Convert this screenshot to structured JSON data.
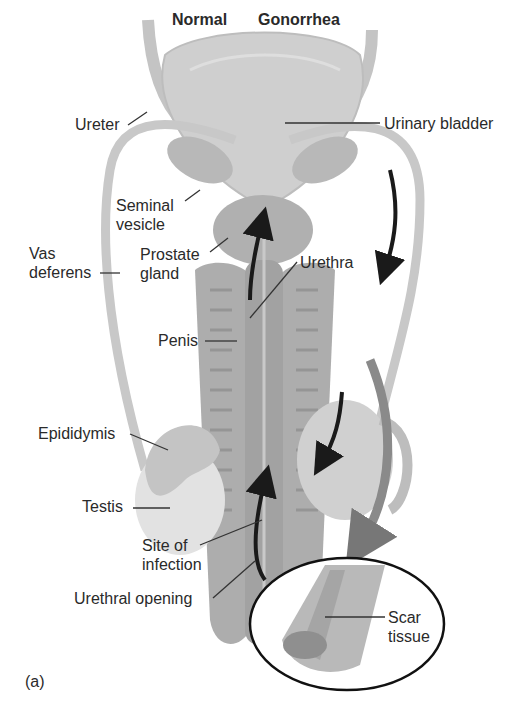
{
  "figure": {
    "panel_label": "(a)",
    "column_headers": {
      "left": "Normal",
      "right": "Gonorrhea"
    },
    "labels": {
      "ureter": "Ureter",
      "urinary_bladder": "Urinary bladder",
      "seminal_vesicle_1": "Seminal",
      "seminal_vesicle_2": "vesicle",
      "vas_deferens_1": "Vas",
      "vas_deferens_2": "deferens",
      "prostate_1": "Prostate",
      "prostate_2": "gland",
      "urethra": "Urethra",
      "penis": "Penis",
      "epididymis": "Epididymis",
      "testis": "Testis",
      "site_1": "Site of",
      "site_2": "infection",
      "urethral_opening": "Urethral opening",
      "scar_1": "Scar",
      "scar_2": "tissue"
    },
    "colors": {
      "tissue_light": "#d9d9d9",
      "tissue_mid": "#bdbdbd",
      "tissue_dark": "#9a9a9a",
      "arrow": "#1a1a1a",
      "leader": "#333333"
    }
  }
}
